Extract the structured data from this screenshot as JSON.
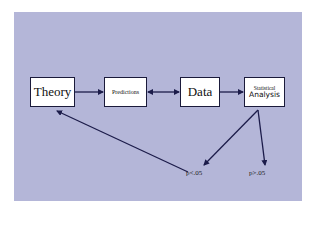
{
  "diagram": {
    "nodes": {
      "theory": "Theory",
      "predictions": "Predictions",
      "data": "Data",
      "statistical_line1": "Statistical",
      "statistical_line2": "Analysis"
    },
    "outcomes": {
      "significant": "p<.05",
      "not_significant": "p>.05"
    },
    "edges": [
      {
        "from": "Theory",
        "to": "Predictions",
        "type": "arrow"
      },
      {
        "from": "Predictions",
        "to": "Data",
        "type": "double-arrow"
      },
      {
        "from": "Data",
        "to": "Statistical Analysis",
        "type": "arrow"
      },
      {
        "from": "Statistical Analysis",
        "to": "p<.05",
        "type": "arrow"
      },
      {
        "from": "Statistical Analysis",
        "to": "p>.05",
        "type": "arrow"
      },
      {
        "from": "p<.05",
        "to": "Theory",
        "type": "arrow"
      }
    ],
    "colors": {
      "background": "#b4b6d8",
      "arrow": "#1c1c4a",
      "box": "#ffffff"
    }
  }
}
